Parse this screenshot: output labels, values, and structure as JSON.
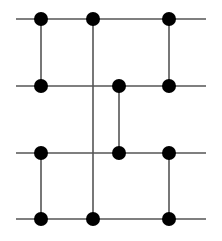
{
  "diagram": {
    "type": "network-graph",
    "canvas": {
      "width": 222,
      "height": 241
    },
    "colors": {
      "background": "#ffffff",
      "line": "#555555",
      "node": "#000000"
    },
    "horizontal_lines": [
      {
        "y": 19,
        "x1": 16,
        "x2": 206
      },
      {
        "y": 86,
        "x1": 16,
        "x2": 206
      },
      {
        "y": 153,
        "x1": 16,
        "x2": 206
      },
      {
        "y": 219,
        "x1": 16,
        "x2": 206
      }
    ],
    "vertical_lines": [
      {
        "x": 41,
        "y1": 19,
        "y2": 86
      },
      {
        "x": 41,
        "y1": 153,
        "y2": 219
      },
      {
        "x": 93,
        "y1": 19,
        "y2": 219
      },
      {
        "x": 119,
        "y1": 86,
        "y2": 153
      },
      {
        "x": 169,
        "y1": 19,
        "y2": 86
      },
      {
        "x": 169,
        "y1": 153,
        "y2": 219
      }
    ],
    "nodes": [
      {
        "x": 41,
        "y": 19
      },
      {
        "x": 93,
        "y": 19
      },
      {
        "x": 169,
        "y": 19
      },
      {
        "x": 41,
        "y": 86
      },
      {
        "x": 119,
        "y": 86
      },
      {
        "x": 169,
        "y": 86
      },
      {
        "x": 41,
        "y": 153
      },
      {
        "x": 119,
        "y": 153
      },
      {
        "x": 169,
        "y": 153
      },
      {
        "x": 41,
        "y": 219
      },
      {
        "x": 93,
        "y": 219
      },
      {
        "x": 169,
        "y": 219
      }
    ],
    "node_radius": 7
  }
}
